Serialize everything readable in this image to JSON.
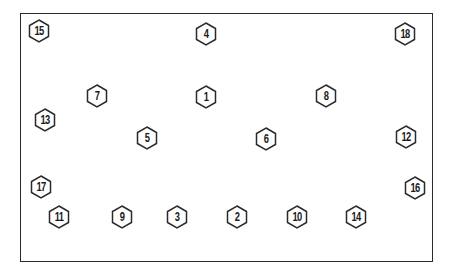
{
  "diagram": {
    "type": "bolt-tightening-sequence",
    "frame_color": "#2a2a2a",
    "bolts": [
      {
        "label": "15",
        "x": 39,
        "y": 31
      },
      {
        "label": "4",
        "x": 206,
        "y": 34
      },
      {
        "label": "18",
        "x": 405,
        "y": 34
      },
      {
        "label": "7",
        "x": 97,
        "y": 96
      },
      {
        "label": "1",
        "x": 206,
        "y": 97
      },
      {
        "label": "8",
        "x": 326,
        "y": 96
      },
      {
        "label": "13",
        "x": 45,
        "y": 120
      },
      {
        "label": "5",
        "x": 147,
        "y": 138
      },
      {
        "label": "6",
        "x": 266,
        "y": 139
      },
      {
        "label": "12",
        "x": 406,
        "y": 137
      },
      {
        "label": "17",
        "x": 41,
        "y": 187
      },
      {
        "label": "16",
        "x": 415,
        "y": 188
      },
      {
        "label": "11",
        "x": 59,
        "y": 217
      },
      {
        "label": "9",
        "x": 122,
        "y": 217
      },
      {
        "label": "3",
        "x": 177,
        "y": 217
      },
      {
        "label": "2",
        "x": 237,
        "y": 217
      },
      {
        "label": "10",
        "x": 297,
        "y": 217
      },
      {
        "label": "14",
        "x": 356,
        "y": 217
      }
    ]
  }
}
